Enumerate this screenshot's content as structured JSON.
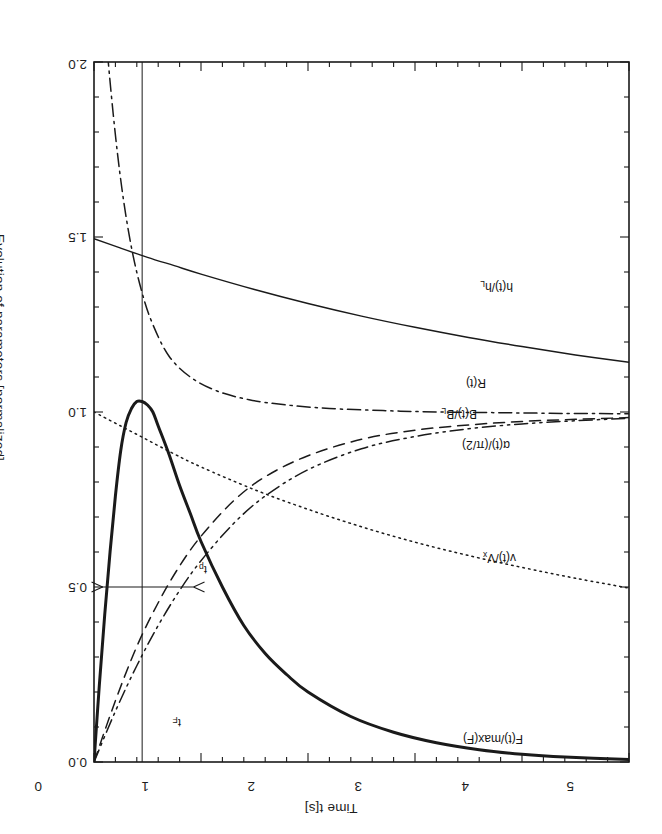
{
  "figure": {
    "orientation_degrees": 180,
    "x_axis": {
      "title": "Time t[s]",
      "ticks": [
        "0",
        "1",
        "2",
        "3",
        "4",
        "5"
      ],
      "min": 0,
      "max": 5,
      "major_step": 1,
      "minor_step": 0.2
    },
    "y_axis": {
      "title": "Evolution of parameters [normalized]",
      "ticks": [
        "0.0",
        "0.5",
        "1.0",
        "1.5",
        "2.0"
      ],
      "min": 0,
      "max": 2,
      "major_step": 0.5,
      "minor_step": 0.1
    },
    "curve_labels": {
      "force": "F(t)/max(F)",
      "velocity": "v(t)/V",
      "velocity_sub": "x",
      "alpha": "α(t)/(π/2)",
      "flux": "B(t)/B",
      "flux_sub": "L",
      "resistance": "R(t)",
      "gap": "h(t)/h",
      "gap_sub": "L"
    },
    "annotations": {
      "t_F": "t",
      "t_F_sub": "F",
      "t_p": "t",
      "t_p_sub": "p"
    },
    "colors": {
      "ink": "#1a1a1a",
      "background": "#ffffff",
      "frame": "#1d1d1d"
    }
  },
  "chart_data": {
    "type": "line",
    "title": "",
    "xlabel": "Time t[s]",
    "ylabel": "Evolution of parameters [normalized]",
    "xlim": [
      0,
      5
    ],
    "ylim": [
      0,
      2
    ],
    "xticks": [
      0,
      1,
      2,
      3,
      4,
      5
    ],
    "yticks": [
      0.0,
      0.5,
      1.0,
      1.5,
      2.0
    ],
    "grid": false,
    "legend": "inline-curve-labels",
    "y_axis_inverted": true,
    "markers": {
      "t_F": {
        "value": 0.45,
        "label": "t_F",
        "note": "vertical line at time of force peak"
      },
      "t_p": {
        "from": 0.08,
        "to": 0.93,
        "y": 0.5,
        "label": "t_p",
        "note": "double headed arrow spanning pulse width at 0.5"
      }
    },
    "series": [
      {
        "name": "F(t)/max(F)",
        "style": "solid-thick",
        "x": [
          0.0,
          0.05,
          0.1,
          0.15,
          0.2,
          0.25,
          0.3,
          0.35,
          0.4,
          0.45,
          0.5,
          0.55,
          0.6,
          0.7,
          0.8,
          0.9,
          1.0,
          1.2,
          1.4,
          1.6,
          1.8,
          2.0,
          2.4,
          2.8,
          3.2,
          3.6,
          4.0,
          4.4,
          5.0
        ],
        "y": [
          0.0,
          0.22,
          0.42,
          0.6,
          0.76,
          0.89,
          0.97,
          1.01,
          1.03,
          1.03,
          1.02,
          1.0,
          0.96,
          0.88,
          0.79,
          0.71,
          0.63,
          0.5,
          0.39,
          0.31,
          0.25,
          0.2,
          0.13,
          0.085,
          0.055,
          0.035,
          0.022,
          0.014,
          0.007
        ]
      },
      {
        "name": "v(t)/Vx",
        "style": "dotted",
        "x": [
          0.0,
          0.25,
          0.5,
          0.75,
          1.0,
          1.5,
          2.0,
          2.5,
          3.0,
          3.5,
          4.0,
          4.5,
          5.0
        ],
        "y": [
          1.0,
          0.96,
          0.92,
          0.88,
          0.843,
          0.778,
          0.722,
          0.672,
          0.628,
          0.59,
          0.556,
          0.525,
          0.497
        ]
      },
      {
        "name": "alpha(t)/(pi/2)",
        "style": "dash-dot-dot",
        "x": [
          0.0,
          0.2,
          0.4,
          0.6,
          0.8,
          1.0,
          1.3,
          1.6,
          2.0,
          2.5,
          3.0,
          3.5,
          4.0,
          4.5,
          5.0
        ],
        "y": [
          0.0,
          0.145,
          0.275,
          0.39,
          0.49,
          0.575,
          0.68,
          0.76,
          0.835,
          0.895,
          0.93,
          0.952,
          0.966,
          0.975,
          0.982
        ]
      },
      {
        "name": "B(t)/BL",
        "style": "dashed",
        "x": [
          0.0,
          0.2,
          0.4,
          0.6,
          0.8,
          1.0,
          1.3,
          1.6,
          2.0,
          2.5,
          3.0,
          3.5,
          4.0,
          4.5,
          5.0
        ],
        "y": [
          0.0,
          0.175,
          0.33,
          0.455,
          0.56,
          0.645,
          0.745,
          0.815,
          0.875,
          0.922,
          0.948,
          0.963,
          0.973,
          0.979,
          0.984
        ]
      },
      {
        "name": "R(t)",
        "style": "dash-dot",
        "x": [
          0.0,
          0.05,
          0.1,
          0.18,
          0.26,
          0.35,
          0.45,
          0.55,
          0.7,
          0.9,
          1.15,
          1.45,
          1.8,
          2.2,
          2.7,
          3.2,
          3.8,
          4.4,
          5.0
        ],
        "y": [
          2.6,
          2.35,
          2.12,
          1.85,
          1.64,
          1.47,
          1.34,
          1.25,
          1.16,
          1.1,
          1.06,
          1.035,
          1.02,
          1.01,
          1.004,
          1.0,
          0.998,
          0.996,
          0.995
        ]
      },
      {
        "name": "h(t)/hL",
        "style": "solid-thin",
        "x": [
          0.0,
          0.25,
          0.5,
          0.75,
          1.0,
          1.5,
          2.0,
          2.5,
          3.0,
          3.5,
          4.0,
          4.5,
          5.0
        ],
        "y": [
          1.495,
          1.468,
          1.442,
          1.418,
          1.394,
          1.35,
          1.31,
          1.274,
          1.242,
          1.213,
          1.187,
          1.163,
          1.142
        ]
      }
    ]
  }
}
